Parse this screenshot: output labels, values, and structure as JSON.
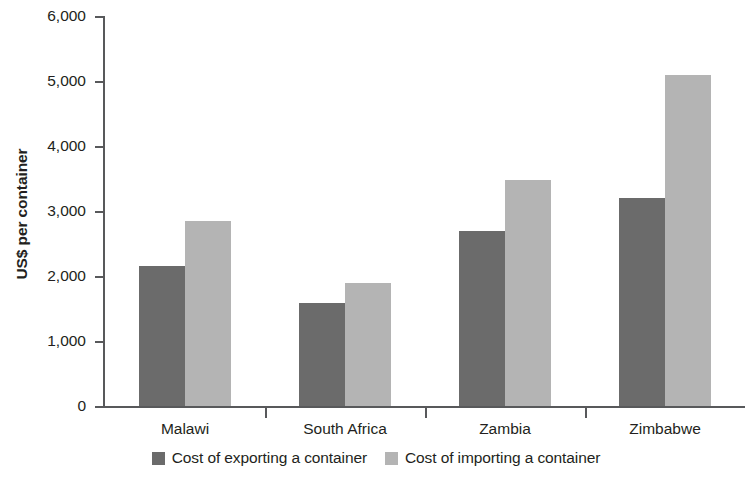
{
  "chart_data": {
    "type": "bar",
    "title": "",
    "subtitle": "",
    "xlabel": "",
    "ylabel": "US$ per container",
    "categories": [
      "Malawi",
      "South Africa",
      "Zambia",
      "Zimbabwe"
    ],
    "series": [
      {
        "name": "Cost of exporting a container",
        "color": "#6b6b6b",
        "values": [
          2150,
          1580,
          2700,
          3200
        ]
      },
      {
        "name": "Cost of importing a container",
        "color": "#b4b4b4",
        "values": [
          2850,
          1900,
          3480,
          5100
        ]
      }
    ],
    "ylim": [
      0,
      6000
    ],
    "ytick_values": [
      0,
      1000,
      2000,
      3000,
      4000,
      5000,
      6000
    ],
    "ytick_labels": [
      "0",
      "1,000",
      "2,000",
      "3,000",
      "4,000",
      "5,000",
      "6,000"
    ],
    "grid": false,
    "legend_position": "bottom",
    "axis_color": "#58595b",
    "background": "#ffffff"
  },
  "legend": {
    "items": [
      {
        "label": "Cost of exporting a container",
        "swatch": "export"
      },
      {
        "label": "Cost of importing a container",
        "swatch": "import"
      }
    ]
  }
}
